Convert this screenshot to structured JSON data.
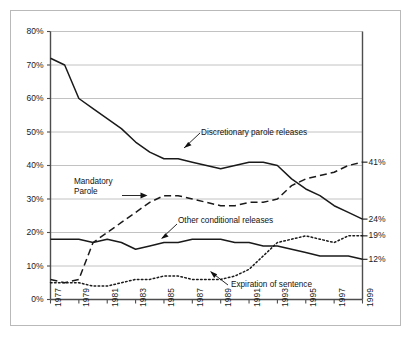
{
  "chart_data": {
    "type": "line",
    "title": "",
    "subtitle": "",
    "xlabel": "",
    "ylabel": "",
    "grid": "horizontal",
    "legend_position": "inline-annotations",
    "xlim": [
      1977,
      1999
    ],
    "ylim": [
      0,
      80
    ],
    "y_tick_labels": [
      "0%",
      "10%",
      "20%",
      "30%",
      "40%",
      "50%",
      "60%",
      "70%",
      "80%"
    ],
    "y_ticks": [
      0,
      10,
      20,
      30,
      40,
      50,
      60,
      70,
      80
    ],
    "x_tick_labels": [
      "1977",
      "1979",
      "1981",
      "1983",
      "1985",
      "1987",
      "1989",
      "1991",
      "1993",
      "1995",
      "1997",
      "1999"
    ],
    "x_ticks": [
      1977,
      1979,
      1981,
      1983,
      1985,
      1987,
      1989,
      1991,
      1993,
      1995,
      1997,
      1999
    ],
    "x": [
      1977,
      1978,
      1979,
      1980,
      1981,
      1982,
      1983,
      1984,
      1985,
      1986,
      1987,
      1988,
      1989,
      1990,
      1991,
      1992,
      1993,
      1994,
      1995,
      1996,
      1997,
      1998,
      1999
    ],
    "series": [
      {
        "name": "Discretionary parole releases",
        "style": "solid",
        "end_label": "24%",
        "values": [
          72,
          70,
          60,
          57,
          54,
          51,
          47,
          44,
          42,
          42,
          41,
          40,
          39,
          40,
          41,
          41,
          40,
          36,
          33,
          31,
          28,
          26,
          24
        ]
      },
      {
        "name": "Mandatory Parole",
        "style": "dashed",
        "end_label": "41%",
        "values": [
          6,
          5,
          6,
          17,
          20,
          23,
          26,
          29,
          31,
          31,
          30,
          29,
          28,
          28,
          29,
          29,
          30,
          34,
          36,
          37,
          38,
          40,
          41
        ]
      },
      {
        "name": "Other conditional releases",
        "style": "solid",
        "end_label": "12%",
        "values": [
          18,
          18,
          18,
          17,
          18,
          17,
          15,
          16,
          17,
          17,
          18,
          18,
          18,
          17,
          17,
          16,
          16,
          15,
          14,
          13,
          13,
          13,
          12
        ]
      },
      {
        "name": "Expiration of sentence",
        "style": "dotted",
        "end_label": "19%",
        "values": [
          5,
          5,
          5,
          4,
          4,
          5,
          6,
          6,
          7,
          7,
          6,
          6,
          6,
          7,
          9,
          13,
          17,
          18,
          19,
          18,
          17,
          19,
          19
        ]
      }
    ],
    "annotations": [
      {
        "id": "discretionary",
        "text_lines": [
          "Discretionary parole releases"
        ]
      },
      {
        "id": "mandatory",
        "text_lines": [
          "Mandatory",
          "Parole"
        ]
      },
      {
        "id": "other-conditional",
        "text_lines": [
          "Other conditional releases"
        ]
      },
      {
        "id": "expiration",
        "text_lines": [
          "Expiration of sentence"
        ]
      }
    ],
    "colors": {
      "line": "#1a1a1a",
      "grid": "#b3b3b3",
      "axis": "#4d4d4d",
      "frame": "#b9b9b9",
      "background": "#ffffff",
      "text": "#1a1a1a"
    }
  }
}
